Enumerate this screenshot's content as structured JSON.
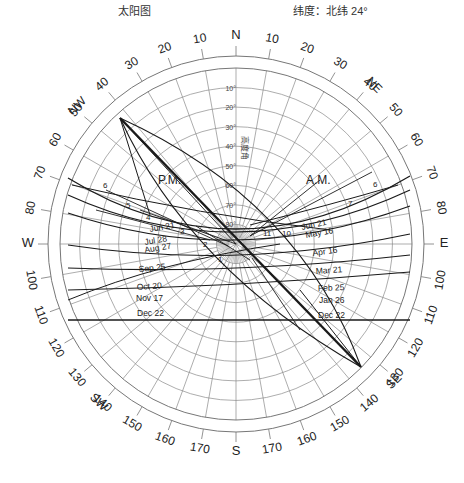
{
  "header": {
    "title": "太阳图",
    "latitude_label": "纬度：北纬 24°"
  },
  "diagram": {
    "center": [
      236,
      244
    ],
    "outer_radius": 188,
    "inner_radius": 176,
    "altitude_axis_label": "高度角",
    "altitude_rings": [
      10,
      20,
      30,
      40,
      50,
      60,
      70,
      80
    ],
    "altitude_labels": [
      "10°",
      "20°",
      "30°",
      "40°",
      "50°",
      "60°",
      "70°",
      "80°"
    ],
    "compass": {
      "N": "N",
      "S": "S",
      "E": "E",
      "W": "W",
      "NE": "NE",
      "NW": "NW",
      "SE": "SE",
      "SW": "SW"
    },
    "azimuth_ticks": [
      10,
      20,
      30,
      40,
      50,
      60,
      70,
      80,
      100,
      110,
      120,
      130,
      140,
      150,
      160,
      170
    ],
    "period_labels": {
      "pm": "P.M.",
      "am": "A.M."
    },
    "date_labels_pm": [
      "Jun 21",
      "Jul 28",
      "Aug 27",
      "Sep 25",
      "Oct 20",
      "Nov 17",
      "Dec 22"
    ],
    "date_labels_am": [
      "Jun 21",
      "May 16",
      "Apr 16",
      "Mar 21",
      "Feb 25",
      "Jan 26",
      "Dec 22"
    ],
    "hour_labels_pm": [
      "6",
      "5",
      "4",
      "3",
      "2",
      "1"
    ],
    "hour_labels_am": [
      "6",
      "7",
      "11",
      "10"
    ],
    "line_color": "#1a1a1a",
    "grid_color": "#8a8a8a"
  }
}
